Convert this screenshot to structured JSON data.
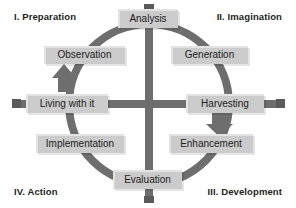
{
  "diagram": {
    "colors": {
      "background": "#ffffff",
      "node_fill": "#e3e3e3",
      "node_text": "#1b1b1b",
      "ring": "#6e6e6e",
      "cross": "#6e6e6e",
      "label_text": "#231f20"
    },
    "quadrants": [
      {
        "id": "I",
        "label": "I. Preparation",
        "position": "top-left"
      },
      {
        "id": "II",
        "label": "II. Imagination",
        "position": "top-right"
      },
      {
        "id": "III",
        "label": "III. Development",
        "position": "bottom-right"
      },
      {
        "id": "IV",
        "label": "IV. Action",
        "position": "bottom-left"
      }
    ],
    "nodes": [
      {
        "id": "analysis",
        "label": "Analysis",
        "angle": "top"
      },
      {
        "id": "generation",
        "label": "Generation",
        "angle": "upper-right"
      },
      {
        "id": "harvesting",
        "label": "Harvesting",
        "angle": "right"
      },
      {
        "id": "enhancement",
        "label": "Enhancement",
        "angle": "lower-right"
      },
      {
        "id": "evaluation",
        "label": "Evaluation",
        "angle": "bottom"
      },
      {
        "id": "implementation",
        "label": "Implementation",
        "angle": "lower-left"
      },
      {
        "id": "living",
        "label": "Living with it",
        "angle": "left"
      },
      {
        "id": "observation",
        "label": "Observation",
        "angle": "upper-left"
      }
    ],
    "arrows": [
      {
        "id": "harvesting-to-enhancement",
        "from": "harvesting",
        "to": "enhancement",
        "direction": "down"
      },
      {
        "id": "living-to-observation",
        "from": "living",
        "to": "observation",
        "direction": "up"
      }
    ],
    "axis_ticks": [
      {
        "id": "tick-top",
        "position": "top"
      },
      {
        "id": "tick-bottom",
        "position": "bottom"
      },
      {
        "id": "tick-left",
        "position": "left"
      },
      {
        "id": "tick-right",
        "position": "right"
      }
    ]
  }
}
